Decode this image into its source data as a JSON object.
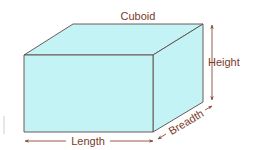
{
  "diagram": {
    "title": "Cuboid",
    "dimensions": {
      "height": "Height",
      "length": "Length",
      "breadth": "Breadth"
    },
    "colors": {
      "face_fill": "#c4f3f6",
      "edge": "#5e4a46",
      "text": "#7a3a2a",
      "arrow": "#8a4a38"
    }
  }
}
